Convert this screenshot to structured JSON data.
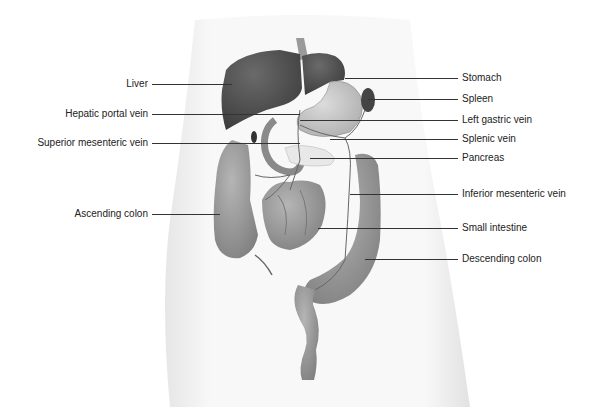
{
  "diagram": {
    "left_labels": [
      {
        "id": "liver",
        "text": "Liver",
        "y": 84,
        "text_right": 148,
        "line_x1": 152,
        "line_x2": 232
      },
      {
        "id": "hepatic-portal-vein",
        "text": "Hepatic portal vein",
        "y": 114,
        "text_right": 148,
        "line_x1": 152,
        "line_x2": 300
      },
      {
        "id": "superior-mesenteric-vein",
        "text": "Superior mesenteric vein",
        "y": 143,
        "text_right": 148,
        "line_x1": 152,
        "line_x2": 300
      },
      {
        "id": "ascending-colon",
        "text": "Ascending colon",
        "y": 214,
        "text_right": 148,
        "line_x1": 152,
        "line_x2": 220
      }
    ],
    "right_labels": [
      {
        "id": "stomach",
        "text": "Stomach",
        "y": 78,
        "text_left": 462,
        "line_x1": 345,
        "line_x2": 458
      },
      {
        "id": "spleen",
        "text": "Spleen",
        "y": 99,
        "text_left": 462,
        "line_x1": 368,
        "line_x2": 458
      },
      {
        "id": "left-gastric-vein",
        "text": "Left gastric vein",
        "y": 120,
        "text_left": 462,
        "line_x1": 300,
        "line_x2": 458
      },
      {
        "id": "splenic-vein",
        "text": "Splenic vein",
        "y": 139,
        "text_left": 462,
        "line_x1": 330,
        "line_x2": 458
      },
      {
        "id": "pancreas",
        "text": "Pancreas",
        "y": 158,
        "text_left": 462,
        "line_x1": 310,
        "line_x2": 458
      },
      {
        "id": "inferior-mesenteric-vein",
        "text": "Inferior mesenteric vein",
        "y": 194,
        "text_left": 462,
        "line_x1": 350,
        "line_x2": 458
      },
      {
        "id": "small-intestine",
        "text": "Small intestine",
        "y": 228,
        "text_left": 462,
        "line_x1": 318,
        "line_x2": 458
      },
      {
        "id": "descending-colon",
        "text": "Descending colon",
        "y": 259,
        "text_left": 462,
        "line_x1": 365,
        "line_x2": 458
      }
    ]
  }
}
